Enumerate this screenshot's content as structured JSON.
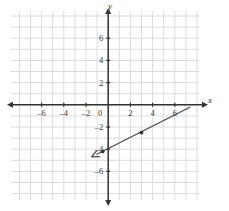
{
  "figure": {
    "type": "coordinate-grid-graph",
    "background_color": "#ffffff",
    "grid_color": "#dcdcdc",
    "axis_color": "#333333",
    "line_color": "#4a4a52"
  },
  "chart_data": {
    "type": "line",
    "title": "",
    "subtitle": "",
    "xlabel": "x",
    "ylabel": "y",
    "grid": true,
    "legend": "none",
    "xlim": [
      -8,
      8
    ],
    "ylim": [
      -8,
      8
    ],
    "x_ticks": [
      -6,
      -4,
      -2,
      0,
      2,
      4,
      6
    ],
    "y_ticks": [
      6,
      4,
      2,
      0,
      -2,
      -4,
      -6
    ],
    "x_tick_labels": [
      "-6",
      "-4",
      "-2",
      "0",
      "2",
      "4",
      "6"
    ],
    "y_tick_labels": [
      "6",
      "4",
      "2",
      "0",
      "-2",
      "-4",
      "-6"
    ],
    "x_minor_step": 1,
    "y_minor_step": 1,
    "series": [
      {
        "name": "ray",
        "kind": "ray",
        "arrow_at": "start",
        "x": [
          -1.5,
          7.4
        ],
        "y": [
          -4.7,
          -0.2
        ],
        "points": [
          {
            "x": -1.5,
            "y": -4.7,
            "marker": "arrowhead"
          },
          {
            "x": -0.5,
            "y": -4.2,
            "marker": "dot"
          },
          {
            "x": 3.0,
            "y": -2.5,
            "marker": "dot"
          },
          {
            "x": 7.4,
            "y": -0.2,
            "marker": "none"
          }
        ]
      }
    ]
  },
  "labels": {
    "y_axis_name": "y",
    "x_axis_name": "x"
  },
  "credit": {
    "text": "© 1989 by Prentice Hall"
  }
}
